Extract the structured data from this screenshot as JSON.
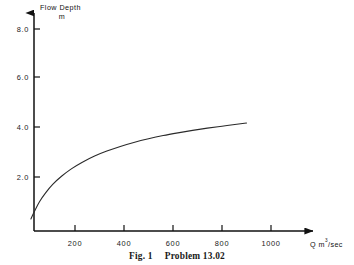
{
  "figure": {
    "caption_label": "Fig. 1",
    "caption_title": "Problem 13.02",
    "background_color": "#ffffff",
    "ink_color": "#111111"
  },
  "chart_data": {
    "type": "line",
    "title": "",
    "xlabel": "Q m3/sec",
    "xlabel_base": "Q m",
    "xlabel_sup": "3",
    "xlabel_tail": "/sec",
    "ylabel": "Flow Depth",
    "yunit": "m",
    "xlim": [
      0,
      1150
    ],
    "ylim": [
      0,
      8.8
    ],
    "xticks": [
      200,
      400,
      600,
      800,
      1000
    ],
    "xtick_labels": [
      "200",
      "400",
      "600",
      "800",
      "1000"
    ],
    "yticks": [
      2.0,
      4.0,
      6.0,
      8.0
    ],
    "ytick_labels": [
      "2.0",
      "4.0",
      "6.0",
      "8.0"
    ],
    "grid": false,
    "legend": "none",
    "series": [
      {
        "name": "Stage-discharge rating curve",
        "x": [
          20,
          35,
          55,
          80,
          110,
          145,
          185,
          230,
          280,
          330,
          385,
          440,
          500,
          560,
          620,
          680,
          740,
          800,
          860,
          900
        ],
        "y": [
          0.3,
          0.62,
          1.0,
          1.36,
          1.71,
          2.03,
          2.33,
          2.6,
          2.85,
          3.05,
          3.24,
          3.4,
          3.55,
          3.68,
          3.79,
          3.89,
          3.98,
          4.06,
          4.14,
          4.19
        ]
      }
    ]
  }
}
